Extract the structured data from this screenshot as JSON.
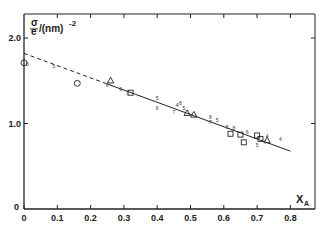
{
  "chart_data": {
    "type": "scatter",
    "title": "",
    "xlabel": "X_A",
    "ylabel": "σ/e /(nm)^-2",
    "xlim": [
      0,
      0.87
    ],
    "ylim": [
      0,
      2.05
    ],
    "grid": false,
    "x_ticks": [
      "0",
      "0.1",
      "0.2",
      "0.3",
      "0.4",
      "0.5",
      "0.6",
      "0.7",
      "0.8"
    ],
    "y_ticks": [
      "0",
      "1.0",
      "2.0"
    ],
    "fit_line": {
      "intercept": 1.82,
      "slope": -1.43,
      "solid_range": [
        0.25,
        0.8
      ],
      "dashed_range": [
        0,
        0.25
      ]
    },
    "series": [
      {
        "name": "circles",
        "marker": "circle",
        "points": [
          [
            0.0,
            1.71
          ],
          [
            0.16,
            1.47
          ]
        ]
      },
      {
        "name": "triangles",
        "marker": "triangle",
        "points": [
          [
            0.26,
            1.5
          ],
          [
            0.49,
            1.12
          ],
          [
            0.51,
            1.1
          ],
          [
            0.73,
            0.8
          ]
        ]
      },
      {
        "name": "squares",
        "marker": "square",
        "points": [
          [
            0.32,
            1.36
          ],
          [
            0.62,
            0.88
          ],
          [
            0.65,
            0.87
          ],
          [
            0.66,
            0.78
          ],
          [
            0.7,
            0.86
          ],
          [
            0.71,
            0.82
          ]
        ]
      },
      {
        "name": "numbered",
        "marker": "digit",
        "points": [
          {
            "x": 0.01,
            "y": 1.7,
            "label": "5"
          },
          {
            "x": 0.09,
            "y": 1.67,
            "label": "5"
          },
          {
            "x": 0.25,
            "y": 1.45,
            "label": "6"
          },
          {
            "x": 0.29,
            "y": 1.4,
            "label": "6"
          },
          {
            "x": 0.31,
            "y": 1.36,
            "label": "7"
          },
          {
            "x": 0.4,
            "y": 1.3,
            "label": "5"
          },
          {
            "x": 0.4,
            "y": 1.18,
            "label": "6"
          },
          {
            "x": 0.46,
            "y": 1.22,
            "label": "4"
          },
          {
            "x": 0.47,
            "y": 1.24,
            "label": "8"
          },
          {
            "x": 0.48,
            "y": 1.18,
            "label": "5"
          },
          {
            "x": 0.45,
            "y": 1.13,
            "label": "7"
          },
          {
            "x": 0.56,
            "y": 1.08,
            "label": "8"
          },
          {
            "x": 0.56,
            "y": 1.02,
            "label": "7"
          },
          {
            "x": 0.58,
            "y": 1.04,
            "label": "5"
          },
          {
            "x": 0.61,
            "y": 0.96,
            "label": "5"
          },
          {
            "x": 0.63,
            "y": 0.95,
            "label": "8"
          },
          {
            "x": 0.67,
            "y": 0.9,
            "label": "6"
          },
          {
            "x": 0.7,
            "y": 0.75,
            "label": "5"
          },
          {
            "x": 0.73,
            "y": 0.85,
            "label": "4"
          },
          {
            "x": 0.77,
            "y": 0.82,
            "label": "4"
          }
        ]
      }
    ]
  },
  "axes": {
    "x_title": "X",
    "x_title_sub": "A",
    "y_title_num": "σ",
    "y_title_den": "e",
    "y_title_unit": "/(nm)",
    "y_title_exp": "-2",
    "origin_y_label": "0"
  }
}
